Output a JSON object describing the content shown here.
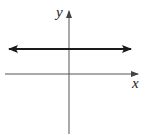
{
  "diagram": {
    "axes": {
      "x_label": "x",
      "y_label": "y"
    },
    "line": {
      "type": "horizontal",
      "position": "above x-axis",
      "arrows": "both ends"
    },
    "colors": {
      "axes": "#555555",
      "line": "#1a1a1a",
      "background": "#ffffff"
    }
  }
}
